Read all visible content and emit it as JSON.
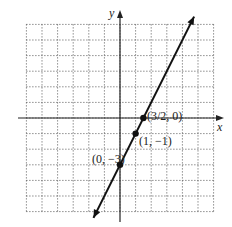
{
  "chart_data": {
    "type": "line",
    "title": "",
    "xlabel": "x",
    "ylabel": "y",
    "xlim": [
      -6,
      6
    ],
    "ylim": [
      -6,
      6
    ],
    "grid": true,
    "grid_style": "dotted",
    "grid_step": 1,
    "series": [
      {
        "name": "y = 2x - 3",
        "equation": "y = 2x - 3",
        "slope": 2,
        "intercept": -3,
        "x": [
          -1.7,
          4.75
        ],
        "y": [
          -6.4,
          6.5
        ],
        "arrows": "both"
      }
    ],
    "points": [
      {
        "x": 1.5,
        "y": 0,
        "label": "(3/2, 0)"
      },
      {
        "x": 1,
        "y": -1,
        "label": "(1, −1)"
      },
      {
        "x": 0,
        "y": -3,
        "label": "(0, −3)"
      }
    ]
  },
  "labels": {
    "x_axis": "x",
    "y_axis": "y",
    "p1": "(3/2, 0)",
    "p2": "(1, −1)",
    "p3": "(0, −3)"
  }
}
